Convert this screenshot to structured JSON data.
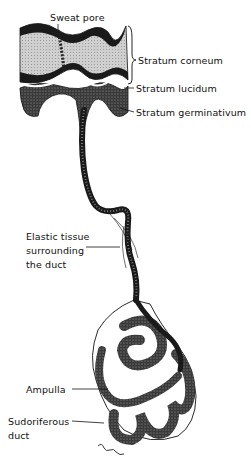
{
  "diagram": {
    "colors": {
      "ink": "#111111",
      "stipple_dark": "#2a2a2a",
      "corneum_fill": "#cfcfcf",
      "background": "#ffffff"
    },
    "labels": {
      "sweat_pore": "Sweat pore",
      "stratum_corneum": "Stratum corneum",
      "stratum_lucidum": "Stratum lucidum",
      "stratum_germinativum": "Stratum germinativum",
      "elastic_line1": "Elastic tissue",
      "elastic_line2": "surrounding",
      "elastic_line3": "the duct",
      "ampulla": "Ampulla",
      "sudoriferous_line1": "Sudoriferous",
      "sudoriferous_line2": "duct"
    }
  }
}
